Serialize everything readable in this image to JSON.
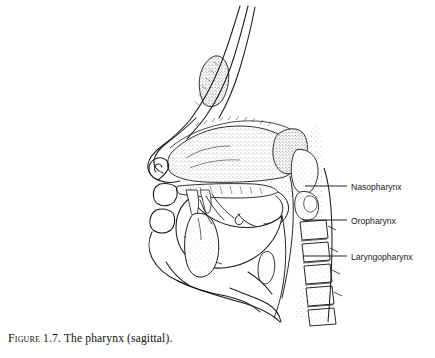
{
  "figure": {
    "caption_prefix": "Figure",
    "caption_number": "1.7.",
    "caption_text": "The pharynx (sagittal).",
    "caption_full": "Figure 1.7. The pharynx (sagittal).",
    "style": "black-and-white stippled line drawing",
    "background_color": "#ffffff",
    "ink_color": "#1a1a1a",
    "stipple_color": "#555555"
  },
  "labels": [
    {
      "id": "nasopharynx",
      "text": "Nasopharynx",
      "text_x": 351,
      "text_y": 190,
      "leader_x1": 305,
      "leader_x2": 347,
      "leader_y": 186
    },
    {
      "id": "oropharynx",
      "text": "Oropharynx",
      "text_x": 351,
      "text_y": 224,
      "leader_x1": 303,
      "leader_x2": 347,
      "leader_y": 220
    },
    {
      "id": "laryngopharynx",
      "text": "Laryngopharynx",
      "text_x": 351,
      "text_y": 260,
      "leader_x1": 303,
      "leader_x2": 347,
      "leader_y": 256
    }
  ],
  "regions": [
    {
      "id": "nasal-cavity",
      "name": "Nasal cavity"
    },
    {
      "id": "frontal-sinus",
      "name": "Frontal sinus"
    },
    {
      "id": "sphenoid-sinus",
      "name": "Sphenoid sinus"
    },
    {
      "id": "hard-palate",
      "name": "Hard palate"
    },
    {
      "id": "soft-palate",
      "name": "Soft palate"
    },
    {
      "id": "tongue",
      "name": "Tongue"
    },
    {
      "id": "mandible",
      "name": "Mandible"
    },
    {
      "id": "epiglottis",
      "name": "Epiglottis"
    },
    {
      "id": "cervical-vertebrae",
      "name": "Cervical vertebrae"
    },
    {
      "id": "nose",
      "name": "External nose"
    },
    {
      "id": "lips",
      "name": "Lips"
    },
    {
      "id": "chin",
      "name": "Chin and neck profile"
    }
  ]
}
